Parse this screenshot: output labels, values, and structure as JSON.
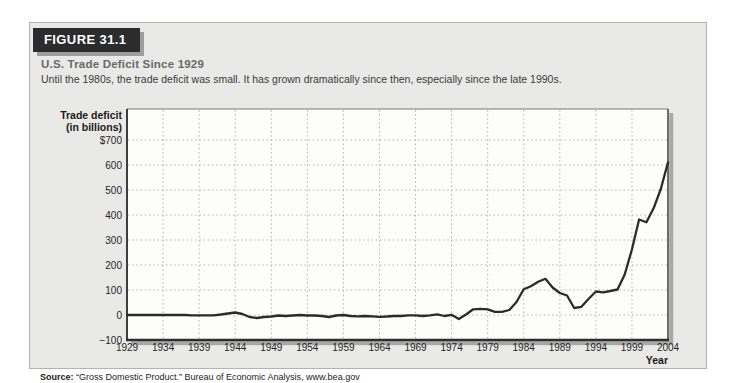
{
  "header": {
    "figure_label": "FIGURE 31.1",
    "title": "U.S. Trade Deficit Since 1929",
    "caption": "Until the 1980s, the trade deficit was small. It has grown dramatically since then, especially since the late 1990s."
  },
  "source": {
    "label": "Source:",
    "text": "“Gross Domestic Product.” Bureau of Economic Analysis, www.bea.gov"
  },
  "colors": {
    "panel_background": "#e9e9e7",
    "panel_border": "#b3b3b0",
    "figure_badge_background": "#2c2c2e",
    "figure_badge_text": "#ffffff",
    "plot_background": "#fdfdfb",
    "gridline": "#b1b1af",
    "line": "#2b2b2b",
    "shadow": "#a8a8a6"
  },
  "chart_data": {
    "type": "line",
    "title": "U.S. Trade Deficit Since 1929",
    "ylabel_line1": "Trade deficit",
    "ylabel_line2": "(in billions)",
    "xlabel": "Year",
    "legend": "none",
    "grid": "dotted, both axes",
    "xlim": [
      1929,
      2004
    ],
    "ylim": [
      -100,
      824
    ],
    "x_ticks": [
      1929,
      1934,
      1939,
      1944,
      1949,
      1954,
      1959,
      1964,
      1969,
      1974,
      1979,
      1984,
      1989,
      1994,
      1999,
      2004
    ],
    "y_ticks": {
      "values": [
        700,
        600,
        500,
        400,
        300,
        200,
        100,
        0,
        -100
      ],
      "labels": [
        "$700",
        "600",
        "500",
        "400",
        "300",
        "200",
        "100",
        "0",
        "−100"
      ]
    },
    "line_color": "#2b2b2b",
    "shadow_color": "#a8a8a6",
    "x": [
      1929,
      1930,
      1931,
      1932,
      1933,
      1934,
      1935,
      1936,
      1937,
      1938,
      1939,
      1940,
      1941,
      1942,
      1943,
      1944,
      1945,
      1946,
      1947,
      1948,
      1949,
      1950,
      1951,
      1952,
      1953,
      1954,
      1955,
      1956,
      1957,
      1958,
      1959,
      1960,
      1961,
      1962,
      1963,
      1964,
      1965,
      1966,
      1967,
      1968,
      1969,
      1970,
      1971,
      1972,
      1973,
      1974,
      1975,
      1976,
      1977,
      1978,
      1979,
      1980,
      1981,
      1982,
      1983,
      1984,
      1985,
      1986,
      1987,
      1988,
      1989,
      1990,
      1991,
      1992,
      1993,
      1994,
      1995,
      1996,
      1997,
      1998,
      1999,
      2000,
      2001,
      2002,
      2003,
      2004
    ],
    "values": [
      0,
      0,
      0,
      0,
      0,
      0,
      0,
      0,
      0,
      -1,
      -1,
      -1,
      -1,
      2,
      6,
      10,
      4,
      -8,
      -12,
      -8,
      -6,
      -2,
      -4,
      -2,
      0,
      -2,
      -2,
      -4,
      -8,
      -2,
      0,
      -4,
      -5,
      -4,
      -5,
      -7,
      -6,
      -4,
      -4,
      -1,
      -1,
      -4,
      -1,
      3,
      -4,
      1,
      -16,
      2,
      23,
      25,
      23,
      13,
      13,
      20,
      52,
      103,
      115,
      133,
      145,
      110,
      88,
      78,
      28,
      33,
      65,
      94,
      91,
      96,
      102,
      162,
      262,
      382,
      371,
      427,
      504,
      611
    ]
  }
}
